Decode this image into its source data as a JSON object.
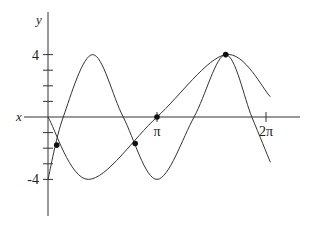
{
  "chart_data": {
    "type": "line",
    "title": "",
    "xlabel": "x",
    "ylabel": "y",
    "xlim": [
      -0.72,
      4.32
    ],
    "ylim": [
      -6.2,
      6.7
    ],
    "x_units": "radians (multiples of pi)",
    "x_ticks": [
      {
        "value_pi": 1,
        "label": "π"
      },
      {
        "value_pi": 2,
        "label": "2π"
      }
    ],
    "y_ticks": [
      {
        "value": 4,
        "label": "4"
      },
      {
        "value": 3,
        "label": ""
      },
      {
        "value": 2,
        "label": ""
      },
      {
        "value": 1,
        "label": ""
      },
      {
        "value": -1,
        "label": ""
      },
      {
        "value": -2,
        "label": ""
      },
      {
        "value": -3,
        "label": ""
      },
      {
        "value": -4,
        "label": "-4"
      }
    ],
    "grid": false,
    "legend": null,
    "series": [
      {
        "name": "fast-wave",
        "description": "higher-frequency sinusoid, amplitude 4, starting at -4",
        "x_pi": [
          0,
          0.14,
          0.41,
          0.69,
          1.0,
          1.34,
          1.63,
          1.87,
          2.04
        ],
        "y": [
          -4,
          0,
          4,
          0,
          -4,
          0,
          4,
          0,
          -2.9
        ]
      },
      {
        "name": "slow-wave",
        "description": "lower-frequency sinusoid, amplitude 4, starting at origin going down",
        "x_pi": [
          0,
          0.37,
          1.0,
          1.63,
          2.04
        ],
        "y": [
          0,
          -4,
          0,
          4,
          1.3
        ]
      }
    ],
    "intersection_points": [
      {
        "x_pi": 0.08,
        "y": -1.8
      },
      {
        "x_pi": 0.8,
        "y": -1.7
      },
      {
        "x_pi": 1.63,
        "y": 4
      }
    ],
    "marked_points": [
      {
        "x_pi": 1.0,
        "y": 0,
        "note": "slow-wave zero at π"
      }
    ]
  }
}
